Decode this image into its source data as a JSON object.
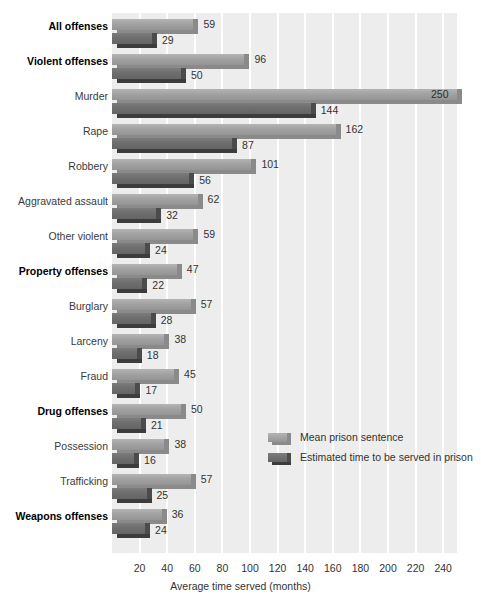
{
  "chart_data": {
    "type": "bar",
    "orientation": "horizontal",
    "title": "",
    "xlabel": "Average time served (months)",
    "ylabel": "",
    "xlim": [
      0,
      250
    ],
    "xticks": [
      20,
      40,
      60,
      80,
      100,
      120,
      140,
      160,
      180,
      200,
      220,
      240
    ],
    "grid": "vertical-white",
    "legend_position": "inside-right-lower",
    "categories": [
      "All offenses",
      "Violent offenses",
      "Murder",
      "Rape",
      "Robbery",
      "Aggravated assault",
      "Other violent",
      "Property offenses",
      "Burglary",
      "Larceny",
      "Fraud",
      "Drug offenses",
      "Possession",
      "Trafficking",
      "Weapons offenses"
    ],
    "category_emphasis": [
      true,
      true,
      false,
      false,
      false,
      false,
      false,
      true,
      false,
      false,
      false,
      true,
      false,
      false,
      true
    ],
    "series": [
      {
        "name": "Mean prison sentence",
        "color": "#9a9a9a",
        "values": [
          59,
          96,
          250,
          162,
          101,
          62,
          59,
          47,
          57,
          38,
          45,
          50,
          38,
          57,
          36
        ]
      },
      {
        "name": "Estimated time to be served in prison",
        "color": "#6b6b6b",
        "values": [
          29,
          50,
          144,
          87,
          56,
          32,
          24,
          22,
          28,
          18,
          17,
          21,
          16,
          25,
          24
        ]
      }
    ]
  },
  "legend": {
    "items": [
      {
        "label": "Mean prison sentence"
      },
      {
        "label": "Estimated time to be served in prison"
      }
    ]
  },
  "axis": {
    "x_title": "Average time served (months)"
  }
}
